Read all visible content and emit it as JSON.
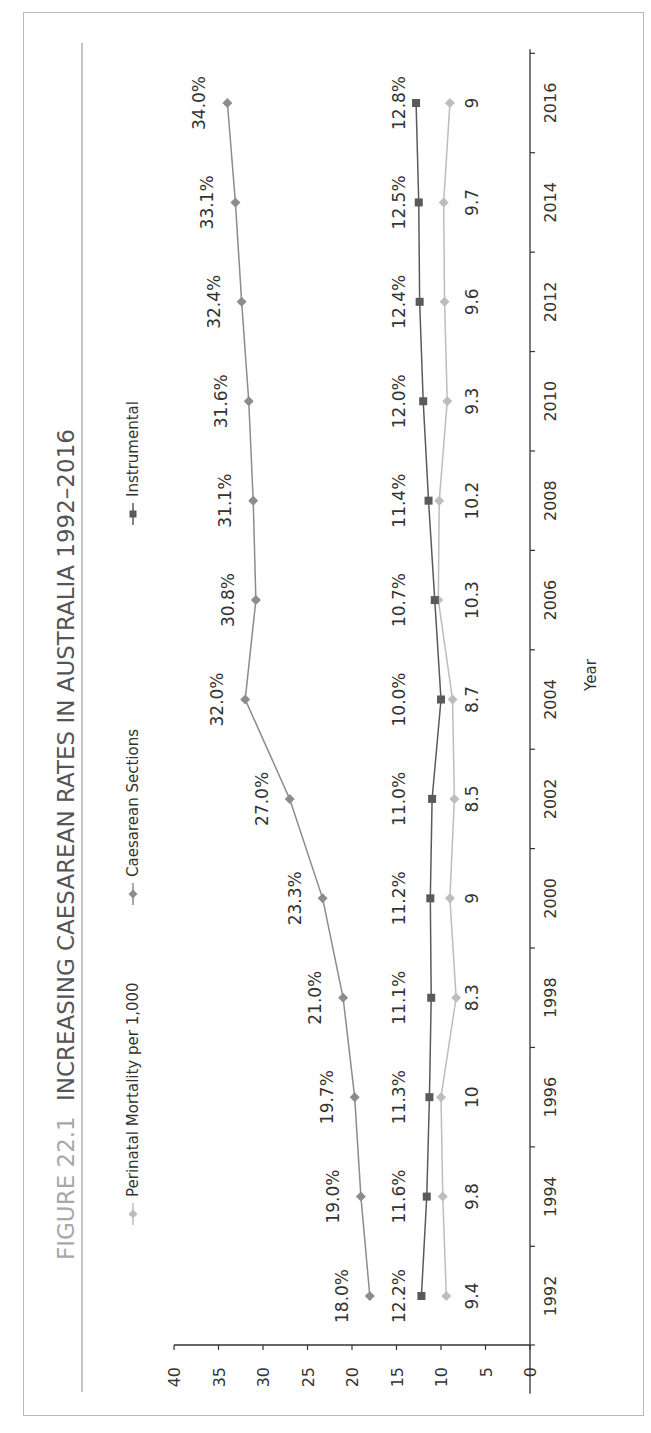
{
  "figure": {
    "number_label": "FIGURE 22.1",
    "title": "INCREASING CAESAREAN RATES IN AUSTRALIA 1992–2016"
  },
  "legend": [
    {
      "name": "Perinatal Mortality per 1,000",
      "marker": "diamond",
      "color": "#bdbdbd"
    },
    {
      "name": "Caesarean Sections",
      "marker": "diamond",
      "color": "#8c8c8c"
    },
    {
      "name": "Instrumental",
      "marker": "square",
      "color": "#5a5a5a"
    }
  ],
  "chart_data": {
    "type": "line",
    "title": "INCREASING CAESAREAN RATES IN AUSTRALIA 1992–2016",
    "orientation": "rotated 90° counter-clockwise (x-axis runs bottom-to-top on the right, y-axis runs right-to-left along the bottom)",
    "xlabel": "Year",
    "ylabel": "",
    "x": [
      1992,
      1994,
      1996,
      1998,
      2000,
      2002,
      2004,
      2006,
      2008,
      2010,
      2012,
      2014,
      2016
    ],
    "x_ticks": [
      "1992",
      "1994",
      "1996",
      "1998",
      "2000",
      "2002",
      "2004",
      "2006",
      "2008",
      "2010",
      "2012",
      "2014",
      "2016"
    ],
    "ylim": [
      0,
      40
    ],
    "y_ticks": [
      "0",
      "5",
      "10",
      "15",
      "20",
      "25",
      "30",
      "35",
      "40"
    ],
    "grid": false,
    "legend_position": "top",
    "series": [
      {
        "name": "Perinatal Mortality per 1,000",
        "values": [
          9.4,
          9.8,
          10,
          8.3,
          9,
          8.5,
          8.7,
          10.3,
          10.2,
          9.3,
          9.6,
          9.7,
          9
        ],
        "labels": [
          "9.4",
          "9.8",
          "10",
          "8.3",
          "9",
          "8.5",
          "8.7",
          "10.3",
          "10.2",
          "9.3",
          "9.6",
          "9.7",
          "9"
        ]
      },
      {
        "name": "Caesarean Sections",
        "values": [
          18.0,
          19.0,
          19.7,
          21.0,
          23.3,
          27.0,
          32.0,
          30.8,
          31.1,
          31.6,
          32.4,
          33.1,
          34.0
        ],
        "labels": [
          "18.0%",
          "19.0%",
          "19.7%",
          "21.0%",
          "23.3%",
          "27.0%",
          "32.0%",
          "30.8%",
          "31.1%",
          "31.6%",
          "32.4%",
          "33.1%",
          "34.0%"
        ]
      },
      {
        "name": "Instrumental",
        "values": [
          12.2,
          11.6,
          11.3,
          11.1,
          11.2,
          11.0,
          10.0,
          10.7,
          11.4,
          12.0,
          12.4,
          12.5,
          12.8
        ],
        "labels": [
          "12.2%",
          "11.6%",
          "11.3%",
          "11.1%",
          "11.2%",
          "11.0%",
          "10.0%",
          "10.7%",
          "11.4%",
          "12.0%",
          "12.4%",
          "12.5%",
          "12.8%"
        ]
      }
    ]
  }
}
